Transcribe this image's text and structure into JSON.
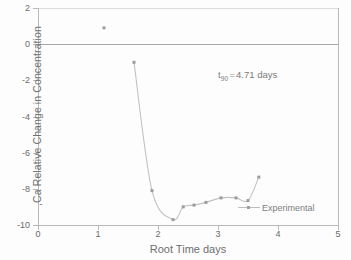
{
  "chart_data": {
    "type": "scatter",
    "title": "",
    "xlabel": "Root Time   days",
    "ylabel": ",Ca  Relative Change in Concentration",
    "xlim": [
      0,
      5
    ],
    "ylim": [
      -10,
      2
    ],
    "xticks": [
      "0",
      "1",
      "2",
      "3",
      "4",
      "5"
    ],
    "yticks": [
      "2",
      "0",
      "-2",
      "-4",
      "-6",
      "-8",
      "-10"
    ],
    "grid": false,
    "zero_line": 0,
    "legend_position": "bottom-right",
    "annotations": [
      {
        "text_prefix": "t",
        "subscript": "90",
        "equals": "=",
        "text_suffix": "4.71 days"
      }
    ],
    "series": [
      {
        "name": "Experimental",
        "marker": "square",
        "color": "#9c9c9c",
        "points": [
          {
            "x": 1.1,
            "y": 0.9,
            "connected": false
          },
          {
            "x": 1.6,
            "y": -1.0,
            "connected": true
          },
          {
            "x": 1.9,
            "y": -8.1,
            "connected": true
          },
          {
            "x": 2.25,
            "y": -9.7,
            "connected": true
          },
          {
            "x": 2.42,
            "y": -9.0,
            "connected": true
          },
          {
            "x": 2.6,
            "y": -8.9,
            "connected": true
          },
          {
            "x": 2.8,
            "y": -8.75,
            "connected": true
          },
          {
            "x": 3.05,
            "y": -8.5,
            "connected": true
          },
          {
            "x": 3.3,
            "y": -8.5,
            "connected": true
          },
          {
            "x": 3.5,
            "y": -8.65,
            "connected": true
          },
          {
            "x": 3.68,
            "y": -7.35,
            "connected": true
          }
        ]
      }
    ]
  },
  "legend": {
    "label": "Experimental"
  }
}
